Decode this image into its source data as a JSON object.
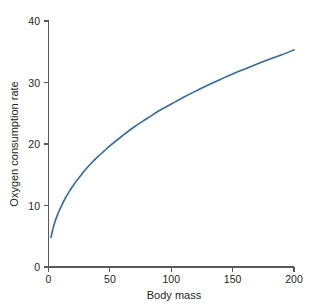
{
  "figure": {
    "background_color": "#ffffff",
    "axis_color": "#58595b",
    "text_color": "#231f20"
  },
  "chart_data": {
    "type": "line",
    "title": "",
    "subtitle": "",
    "xlabel": "Body mass",
    "ylabel": "Oxygen consumption rate",
    "xlim": [
      0,
      200
    ],
    "ylim": [
      0,
      40
    ],
    "xticks": [
      0,
      50,
      100,
      150,
      200
    ],
    "xticklabels": [
      "0",
      "50",
      "100",
      "150",
      "200"
    ],
    "yticks": [
      0,
      10,
      20,
      30,
      40
    ],
    "yticklabels": [
      "0",
      "10",
      "20",
      "30",
      "40"
    ],
    "grid": false,
    "legend": null,
    "legend_position": "none",
    "annotations": [],
    "series": [
      {
        "name": "oxygen-consumption-curve",
        "color": "#2f6ba6",
        "line_width": 1.6,
        "relationship": "power law: rate = 3.55 * mass^0.445",
        "x": [
          2,
          4,
          6,
          8,
          10,
          14,
          18,
          22,
          26,
          30,
          35,
          40,
          45,
          50,
          60,
          70,
          80,
          90,
          100,
          110,
          120,
          130,
          140,
          150,
          160,
          170,
          180,
          190,
          200
        ],
        "values": [
          4.8,
          6.5,
          7.8,
          8.8,
          9.7,
          11.3,
          12.6,
          13.8,
          14.8,
          15.8,
          16.9,
          17.9,
          18.8,
          19.7,
          21.3,
          22.8,
          24.1,
          25.4,
          26.5,
          27.6,
          28.6,
          29.6,
          30.5,
          31.4,
          32.2,
          33.0,
          33.8,
          34.5,
          35.3
        ]
      }
    ]
  },
  "axes": {
    "x_label": "Body mass",
    "y_label": "Oxygen consumption rate",
    "x_tick_0": "0",
    "x_tick_1": "50",
    "x_tick_2": "100",
    "x_tick_3": "150",
    "x_tick_4": "200",
    "y_tick_0": "0",
    "y_tick_1": "10",
    "y_tick_2": "20",
    "y_tick_3": "30",
    "y_tick_4": "40"
  }
}
